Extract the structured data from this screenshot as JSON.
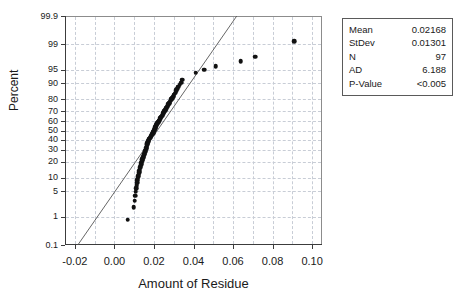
{
  "chart_data": {
    "type": "scatter",
    "subtype": "normal-probability-plot",
    "title": "",
    "xlabel": "Amount of Residue",
    "ylabel": "Percent",
    "xlim": [
      -0.025,
      0.105
    ],
    "ylim_percent": [
      0.1,
      99.9
    ],
    "grid": true,
    "x_ticks": [
      "-0.02",
      "0.00",
      "0.02",
      "0.04",
      "0.06",
      "0.08",
      "0.10"
    ],
    "x_tick_values": [
      -0.02,
      0.0,
      0.02,
      0.04,
      0.06,
      0.08,
      0.1
    ],
    "x_minor_gridlines": [
      -0.01,
      0.01,
      0.03,
      0.05,
      0.07,
      0.09
    ],
    "y_ticks": [
      "99.9",
      "99",
      "95",
      "90",
      "80",
      "70",
      "60",
      "50",
      "40",
      "30",
      "20",
      "10",
      "5",
      "1",
      "0.1"
    ],
    "y_tick_values": [
      99.9,
      99,
      95,
      90,
      80,
      70,
      60,
      50,
      40,
      30,
      20,
      10,
      5,
      1,
      0.1
    ],
    "fit_line": {
      "label": "normal-reference-line",
      "mean": 0.02168,
      "stdev": 0.01301,
      "color": "#555555"
    },
    "points": [
      {
        "x": 0.0068,
        "p": 0.8
      },
      {
        "x": 0.0098,
        "p": 1.9
      },
      {
        "x": 0.0103,
        "p": 2.9
      },
      {
        "x": 0.0106,
        "p": 3.9
      },
      {
        "x": 0.0108,
        "p": 4.9
      },
      {
        "x": 0.011,
        "p": 5.9
      },
      {
        "x": 0.0112,
        "p": 6.9
      },
      {
        "x": 0.0114,
        "p": 7.9
      },
      {
        "x": 0.0116,
        "p": 8.9
      },
      {
        "x": 0.0118,
        "p": 9.9
      },
      {
        "x": 0.012,
        "p": 11.0
      },
      {
        "x": 0.0122,
        "p": 12.0
      },
      {
        "x": 0.0124,
        "p": 13.0
      },
      {
        "x": 0.0126,
        "p": 14.0
      },
      {
        "x": 0.0128,
        "p": 15.0
      },
      {
        "x": 0.013,
        "p": 16.0
      },
      {
        "x": 0.0132,
        "p": 17.0
      },
      {
        "x": 0.0134,
        "p": 18.0
      },
      {
        "x": 0.0136,
        "p": 19.1
      },
      {
        "x": 0.0138,
        "p": 20.1
      },
      {
        "x": 0.014,
        "p": 21.1
      },
      {
        "x": 0.0142,
        "p": 22.1
      },
      {
        "x": 0.0145,
        "p": 23.1
      },
      {
        "x": 0.0147,
        "p": 24.1
      },
      {
        "x": 0.0149,
        "p": 25.1
      },
      {
        "x": 0.0151,
        "p": 26.1
      },
      {
        "x": 0.0153,
        "p": 27.2
      },
      {
        "x": 0.0155,
        "p": 28.2
      },
      {
        "x": 0.0157,
        "p": 29.2
      },
      {
        "x": 0.0158,
        "p": 30.2
      },
      {
        "x": 0.016,
        "p": 31.2
      },
      {
        "x": 0.0161,
        "p": 32.2
      },
      {
        "x": 0.0163,
        "p": 33.2
      },
      {
        "x": 0.0164,
        "p": 34.3
      },
      {
        "x": 0.0166,
        "p": 35.3
      },
      {
        "x": 0.0167,
        "p": 36.3
      },
      {
        "x": 0.0169,
        "p": 37.3
      },
      {
        "x": 0.017,
        "p": 38.3
      },
      {
        "x": 0.0172,
        "p": 39.3
      },
      {
        "x": 0.0174,
        "p": 40.3
      },
      {
        "x": 0.0177,
        "p": 41.4
      },
      {
        "x": 0.018,
        "p": 42.4
      },
      {
        "x": 0.0183,
        "p": 43.4
      },
      {
        "x": 0.0186,
        "p": 44.4
      },
      {
        "x": 0.0189,
        "p": 45.4
      },
      {
        "x": 0.0192,
        "p": 46.4
      },
      {
        "x": 0.0195,
        "p": 47.4
      },
      {
        "x": 0.0197,
        "p": 48.5
      },
      {
        "x": 0.0199,
        "p": 49.5
      },
      {
        "x": 0.0201,
        "p": 50.5
      },
      {
        "x": 0.0203,
        "p": 51.5
      },
      {
        "x": 0.0205,
        "p": 52.5
      },
      {
        "x": 0.0207,
        "p": 53.5
      },
      {
        "x": 0.0209,
        "p": 54.5
      },
      {
        "x": 0.0211,
        "p": 55.6
      },
      {
        "x": 0.0214,
        "p": 56.6
      },
      {
        "x": 0.0217,
        "p": 57.6
      },
      {
        "x": 0.022,
        "p": 58.6
      },
      {
        "x": 0.0223,
        "p": 59.6
      },
      {
        "x": 0.0226,
        "p": 60.6
      },
      {
        "x": 0.0229,
        "p": 61.6
      },
      {
        "x": 0.0232,
        "p": 62.7
      },
      {
        "x": 0.0235,
        "p": 63.7
      },
      {
        "x": 0.0238,
        "p": 64.7
      },
      {
        "x": 0.0241,
        "p": 65.7
      },
      {
        "x": 0.0244,
        "p": 66.7
      },
      {
        "x": 0.0247,
        "p": 67.7
      },
      {
        "x": 0.025,
        "p": 68.8
      },
      {
        "x": 0.0253,
        "p": 69.8
      },
      {
        "x": 0.0256,
        "p": 70.8
      },
      {
        "x": 0.0259,
        "p": 71.8
      },
      {
        "x": 0.0263,
        "p": 72.8
      },
      {
        "x": 0.0266,
        "p": 73.8
      },
      {
        "x": 0.0269,
        "p": 74.8
      },
      {
        "x": 0.0272,
        "p": 75.9
      },
      {
        "x": 0.0276,
        "p": 76.9
      },
      {
        "x": 0.028,
        "p": 77.9
      },
      {
        "x": 0.0284,
        "p": 78.9
      },
      {
        "x": 0.0288,
        "p": 79.9
      },
      {
        "x": 0.0292,
        "p": 80.9
      },
      {
        "x": 0.0296,
        "p": 82.0
      },
      {
        "x": 0.03,
        "p": 83.0
      },
      {
        "x": 0.0304,
        "p": 84.0
      },
      {
        "x": 0.0309,
        "p": 85.0
      },
      {
        "x": 0.0314,
        "p": 86.0
      },
      {
        "x": 0.0319,
        "p": 87.0
      },
      {
        "x": 0.0324,
        "p": 88.1
      },
      {
        "x": 0.033,
        "p": 89.1
      },
      {
        "x": 0.0337,
        "p": 90.1
      },
      {
        "x": 0.0344,
        "p": 91.4
      },
      {
        "x": 0.0412,
        "p": 94.0
      },
      {
        "x": 0.0455,
        "p": 95.0
      },
      {
        "x": 0.0512,
        "p": 95.9
      },
      {
        "x": 0.0638,
        "p": 96.9
      },
      {
        "x": 0.0712,
        "p": 97.7
      },
      {
        "x": 0.0908,
        "p": 99.2
      }
    ]
  },
  "stats_box": {
    "name": "statistics-summary",
    "rows": [
      {
        "key": "Mean",
        "value": "0.02168"
      },
      {
        "key": "StDev",
        "value": "0.01301"
      },
      {
        "key": "N",
        "value": "97"
      },
      {
        "key": "AD",
        "value": "6.188"
      },
      {
        "key": "P-Value",
        "value": "<0.005"
      }
    ]
  }
}
